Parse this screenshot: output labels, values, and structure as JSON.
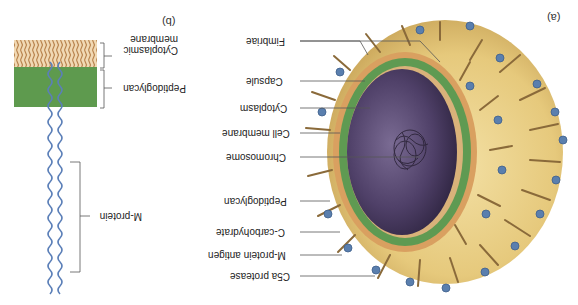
{
  "figure": {
    "orientation": "rotated-180",
    "panel_a": {
      "tag": "(a)",
      "labels": [
        {
          "id": "fimbriae",
          "text": "Fimbriae"
        },
        {
          "id": "capsule",
          "text": "Capsule"
        },
        {
          "id": "cytoplasm",
          "text": "Cytoplasm"
        },
        {
          "id": "cell-membrane",
          "text": "Cell membrane"
        },
        {
          "id": "chromosome",
          "text": "Chromosome"
        },
        {
          "id": "peptidoglycan",
          "text": "Peptidoglycan"
        },
        {
          "id": "c-carbohydrate",
          "text": "C-carbohydrate"
        },
        {
          "id": "m-protein-antigen",
          "text": "M-protein antigen"
        },
        {
          "id": "c5a-protease",
          "text": "C5a protease"
        }
      ]
    },
    "panel_b": {
      "tag": "(b)",
      "labels": [
        {
          "id": "cytoplasmic-membrane",
          "text": "Cytoplasmic membrane"
        },
        {
          "id": "peptidoglycan",
          "text": "Peptidoglycan"
        },
        {
          "id": "m-protein",
          "text": "M-protein"
        }
      ]
    },
    "colors": {
      "capsule": "#e8cf86",
      "cytoplasm": "#4b3d62",
      "peptidoglycan": "#5f9a52",
      "membrane": "#d7a978",
      "fimbriae": "#8a6a3a",
      "m_protein": "#5b7fb8",
      "antigen": "#5a7fae",
      "leader_line": "#555555"
    }
  }
}
